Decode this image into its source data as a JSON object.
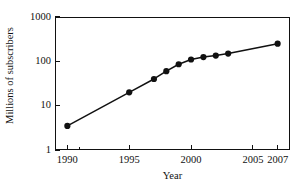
{
  "chart_data": {
    "type": "line",
    "title": "",
    "xlabel": "Year",
    "ylabel": "Millions of subscribers",
    "xlim": [
      1989,
      2008
    ],
    "ylim": [
      1,
      1000
    ],
    "yscale": "log",
    "grid": false,
    "legend": null,
    "marker": "filled-circle",
    "line_color": "#111111",
    "marker_color": "#111111",
    "x": [
      1990,
      1995,
      1997,
      1998,
      1999,
      2000,
      2001,
      2002,
      2003,
      2007
    ],
    "values": [
      3.5,
      20,
      40,
      60,
      86,
      110,
      125,
      135,
      150,
      250
    ],
    "points": [
      {
        "year": 1990,
        "subscribers": 3.5
      },
      {
        "year": 1995,
        "subscribers": 20
      },
      {
        "year": 1997,
        "subscribers": 40
      },
      {
        "year": 1998,
        "subscribers": 60
      },
      {
        "year": 1999,
        "subscribers": 86
      },
      {
        "year": 2000,
        "subscribers": 110
      },
      {
        "year": 2001,
        "subscribers": 125
      },
      {
        "year": 2002,
        "subscribers": 135
      },
      {
        "year": 2003,
        "subscribers": 150
      },
      {
        "year": 2007,
        "subscribers": 250
      }
    ],
    "xticks": [
      {
        "value": 1990,
        "label": "1990",
        "minor": false
      },
      {
        "value": 1991,
        "label": "",
        "minor": true
      },
      {
        "value": 1995,
        "label": "1995",
        "minor": false
      },
      {
        "value": 2000,
        "label": "2000",
        "minor": false
      },
      {
        "value": 2005,
        "label": "2005",
        "minor": false
      },
      {
        "value": 2007,
        "label": "2007",
        "minor": false
      }
    ],
    "yticks": [
      {
        "value": 1,
        "label": "1"
      },
      {
        "value": 10,
        "label": "10"
      },
      {
        "value": 100,
        "label": "100"
      },
      {
        "value": 1000,
        "label": "1000"
      }
    ]
  }
}
